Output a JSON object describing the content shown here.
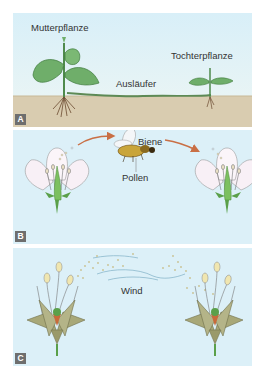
{
  "panels": [
    {
      "id": "A",
      "badge": "A",
      "labels": {
        "mother_plant": "Mutterpflanze",
        "runner": "Ausläufer",
        "daughter_plant": "Tochterpflanze"
      }
    },
    {
      "id": "B",
      "badge": "B",
      "labels": {
        "bee": "Biene",
        "pollen": "Pollen"
      }
    },
    {
      "id": "C",
      "badge": "C",
      "labels": {
        "wind": "Wind"
      }
    }
  ],
  "colors": {
    "sky": "#dcf0f8",
    "soil": "#d9ccb0",
    "leaf": "#6fae6a",
    "petal": "#f8f0f6",
    "arrow": "#c96f45",
    "bract": "#a8a878",
    "badge": "#6e6e6e"
  }
}
